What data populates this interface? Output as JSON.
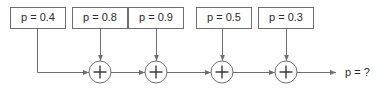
{
  "diagram": {
    "type": "signal-flow-adder-chain",
    "background_color": "#ffffff",
    "line_color": "#6e6e6e",
    "text_color": "#2b2b2b",
    "bus_y": 72,
    "nodes": [
      {
        "id": "box1",
        "label": "p = 0.4",
        "value": 0.4,
        "x": 10,
        "y": 7,
        "width": 55,
        "height": 21,
        "drop_x": 37,
        "feeds": "bus-start"
      },
      {
        "id": "box2",
        "label": "p = 0.8",
        "value": 0.8,
        "x": 72,
        "y": 7,
        "width": 55,
        "height": 21,
        "drop_x": 100,
        "feeds": "adder1"
      },
      {
        "id": "box3",
        "label": "p = 0.9",
        "value": 0.9,
        "x": 128,
        "y": 7,
        "width": 55,
        "height": 21,
        "drop_x": 156,
        "feeds": "adder2"
      },
      {
        "id": "box4",
        "label": "p = 0.5",
        "value": 0.5,
        "x": 196,
        "y": 7,
        "width": 55,
        "height": 21,
        "drop_x": 222,
        "feeds": "adder3"
      },
      {
        "id": "box5",
        "label": "p = 0.3",
        "value": 0.3,
        "x": 258,
        "y": 7,
        "width": 55,
        "height": 21,
        "drop_x": 286,
        "feeds": "adder4"
      }
    ],
    "adders": [
      {
        "id": "adder1",
        "symbol": "+",
        "cx": 100,
        "cy": 72,
        "r": 11
      },
      {
        "id": "adder2",
        "symbol": "+",
        "cx": 156,
        "cy": 72,
        "r": 11
      },
      {
        "id": "adder3",
        "symbol": "+",
        "cx": 222,
        "cy": 72,
        "r": 11
      },
      {
        "id": "adder4",
        "symbol": "+",
        "cx": 286,
        "cy": 72,
        "r": 11
      }
    ],
    "output": {
      "label": "p = ?",
      "value": null,
      "arrow_start_x": 297,
      "arrow_end_x": 336,
      "text_x": 345,
      "y": 72
    }
  }
}
